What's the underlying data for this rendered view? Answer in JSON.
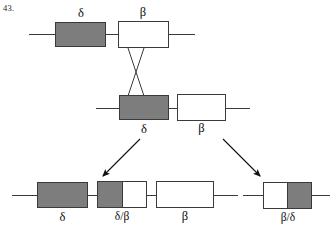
{
  "figure": {
    "number": "43."
  },
  "diagram": {
    "type": "genetic-recombination-crossover",
    "rows": {
      "parent_top": {
        "name": "top-parental-chromosome",
        "genes": [
          {
            "id": "delta",
            "label": "δ",
            "fill": "gray"
          },
          {
            "id": "beta",
            "label": "β",
            "fill": "white"
          }
        ],
        "label_position": "above"
      },
      "parent_bottom": {
        "name": "bottom-parental-chromosome",
        "genes": [
          {
            "id": "delta",
            "label": "δ",
            "fill": "gray"
          },
          {
            "id": "beta",
            "label": "β",
            "fill": "white"
          }
        ],
        "label_position": "below"
      },
      "product_left": {
        "name": "left-recombinant-chromosome",
        "genes": [
          {
            "id": "delta",
            "label": "δ",
            "fill": "gray"
          },
          {
            "id": "delta-beta",
            "label": "δ/β",
            "fill": "split-gray-white"
          },
          {
            "id": "beta",
            "label": "β",
            "fill": "white"
          }
        ],
        "label_position": "below"
      },
      "product_right": {
        "name": "right-recombinant-chromosome",
        "genes": [
          {
            "id": "beta-delta",
            "label": "β/δ",
            "fill": "split-white-gray"
          }
        ],
        "label_position": "below"
      }
    },
    "crossover": {
      "name": "crossover-x",
      "description": "X-shaped strand exchange between top and bottom chromosomes"
    },
    "arrows": [
      {
        "name": "arrow-to-left-product",
        "direction": "down-left"
      },
      {
        "name": "arrow-to-right-product",
        "direction": "down-right"
      }
    ],
    "colors": {
      "gene_fill_gray": "#7d7d7d",
      "gene_fill_white": "#ffffff",
      "stroke": "#3a3a3a",
      "text": "#0d0d0d",
      "background": "#ffffff"
    }
  }
}
